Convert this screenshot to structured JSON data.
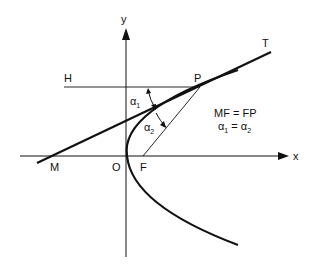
{
  "diagram": {
    "axes": {
      "x_label": "x",
      "y_label": "y"
    },
    "points": {
      "H": "H",
      "P": "P",
      "T": "T",
      "M": "M",
      "O": "O",
      "F": "F"
    },
    "angles": {
      "a1": "α",
      "a1_sub": "1",
      "a2": "α",
      "a2_sub": "2"
    },
    "equations": {
      "line1": "MF = FP",
      "line2_left": "α",
      "line2_left_sub": "1",
      "line2_eq": " = ",
      "line2_right": "α",
      "line2_right_sub": "2"
    },
    "colors": {
      "ink": "#111111",
      "background": "#ffffff"
    }
  }
}
